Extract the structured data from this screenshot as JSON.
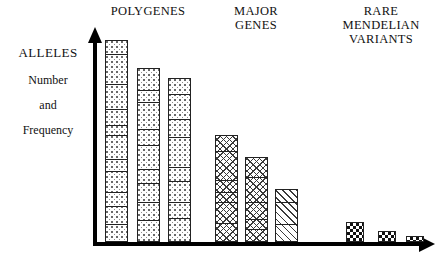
{
  "axis": {
    "y_title": "ALLELES",
    "y_sub_1": "Number",
    "y_sub_2": "and",
    "y_sub_3": "Frequency",
    "y_arrow_icon": "arrow-up-icon",
    "x_arrow_icon": "arrow-right-icon",
    "line_color": "#000000"
  },
  "groups": [
    {
      "id": "polygenes",
      "header_lines": [
        "POLYGENES"
      ],
      "fill": "dotted",
      "bars": [
        {
          "label": "polygene-bar-1",
          "height": 202,
          "segments": [
            14,
            30,
            26,
            16,
            10,
            24,
            12,
            22,
            14,
            18,
            16
          ]
        },
        {
          "label": "polygene-bar-2",
          "height": 174,
          "segments": [
            22,
            12,
            28,
            16,
            24,
            14,
            20,
            18,
            20
          ]
        },
        {
          "label": "polygene-bar-3",
          "height": 164,
          "segments": [
            16,
            26,
            18,
            30,
            14,
            22,
            16,
            22
          ]
        }
      ]
    },
    {
      "id": "major-genes",
      "header_lines": [
        "MAJOR",
        "GENES"
      ],
      "fill": "crosshatch",
      "bars": [
        {
          "label": "major-gene-bar-1",
          "height": 107,
          "segments": [
            16,
            30,
            12,
            10,
            22,
            17
          ]
        },
        {
          "label": "major-gene-bar-2",
          "height": 85,
          "segments": [
            20,
            26,
            18,
            10,
            11
          ]
        },
        {
          "label": "major-gene-bar-3",
          "height": 53,
          "segments": [
            14,
            22,
            17
          ],
          "fill": "diagonal"
        }
      ]
    },
    {
      "id": "rare-mendelian-variants",
      "header_lines": [
        "RARE",
        "MENDELIAN",
        "VARIANTS"
      ],
      "fill": "checker",
      "bars": [
        {
          "label": "rare-variant-bar-1",
          "height": 20,
          "segments": [
            20
          ]
        },
        {
          "label": "rare-variant-bar-2",
          "height": 11,
          "segments": [
            11
          ]
        },
        {
          "label": "rare-variant-bar-3",
          "height": 6,
          "segments": [
            6
          ]
        }
      ]
    }
  ],
  "chart_data": {
    "type": "bar",
    "title": "",
    "subtitle": "",
    "xlabel": "",
    "ylabel": "ALLELES Number and Frequency",
    "categories": [
      "POLYGENES 1",
      "POLYGENES 2",
      "POLYGENES 3",
      "MAJOR GENES 1",
      "MAJOR GENES 2",
      "MAJOR GENES 3",
      "RARE MENDELIAN VARIANTS 1",
      "RARE MENDELIAN VARIANTS 2",
      "RARE MENDELIAN VARIANTS 3"
    ],
    "values": [
      202,
      174,
      164,
      107,
      85,
      53,
      20,
      11,
      6
    ],
    "group_labels": [
      "POLYGENES",
      "MAJOR GENES",
      "RARE MENDELIAN VARIANTS"
    ],
    "legend": [],
    "grid": false,
    "axis_ticks": false,
    "axis_arrows": true,
    "ylim": [
      0,
      212
    ]
  }
}
